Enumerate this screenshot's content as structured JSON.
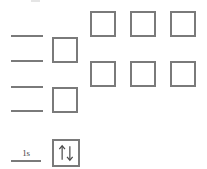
{
  "diagram": {
    "stroke_color": "#7a7a7a",
    "background_color": "#ffffff",
    "artifact": {
      "name": "top-edge-artifact"
    },
    "levels": [
      {
        "id": "level-1",
        "label": "",
        "x": 11,
        "y": 35,
        "width": 32
      },
      {
        "id": "level-2",
        "label": "",
        "x": 11,
        "y": 60,
        "width": 32
      },
      {
        "id": "level-3",
        "label": "",
        "x": 11,
        "y": 86,
        "width": 32
      },
      {
        "id": "level-4",
        "label": "",
        "x": 11,
        "y": 110,
        "width": 32
      }
    ],
    "middle_boxes": [
      {
        "id": "middle-box-1",
        "x": 52,
        "y": 37,
        "size": 26,
        "occupied": false
      },
      {
        "id": "middle-box-2",
        "x": 52,
        "y": 87,
        "size": 26,
        "occupied": false
      }
    ],
    "right_boxes_row1": [
      {
        "id": "right-box-r1-c1",
        "x": 90,
        "y": 11,
        "size": 26,
        "occupied": false
      },
      {
        "id": "right-box-r1-c2",
        "x": 130,
        "y": 11,
        "size": 26,
        "occupied": false
      },
      {
        "id": "right-box-r1-c3",
        "x": 170,
        "y": 11,
        "size": 26,
        "occupied": false
      }
    ],
    "right_boxes_row2": [
      {
        "id": "right-box-r2-c1",
        "x": 90,
        "y": 61,
        "size": 26,
        "occupied": false
      },
      {
        "id": "right-box-r2-c2",
        "x": 130,
        "y": 61,
        "size": 26,
        "occupied": false
      },
      {
        "id": "right-box-r2-c3",
        "x": 170,
        "y": 61,
        "size": 26,
        "occupied": false
      }
    ],
    "ground_level": {
      "label": "1s",
      "label_x": 14,
      "label_y": 149,
      "underline_x": 11,
      "underline_y": 160,
      "underline_width": 30,
      "box": {
        "id": "ground-box-1s",
        "x": 52,
        "y": 139,
        "size": 28,
        "occupied": true
      },
      "electrons": [
        {
          "name": "spin-up-arrow",
          "direction": "up",
          "glyph": "↑"
        },
        {
          "name": "spin-down-arrow",
          "direction": "down",
          "glyph": "↓"
        }
      ]
    }
  }
}
